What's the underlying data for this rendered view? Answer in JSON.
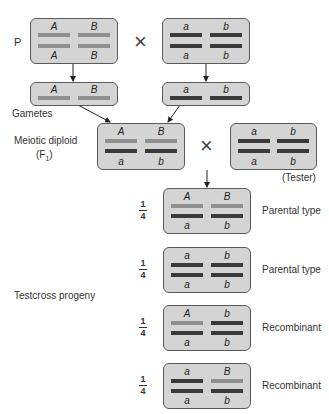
{
  "labels": {
    "p": "P",
    "gametes": "Gametes",
    "f1_line1": "Meiotic diploid",
    "f1_line2": "(F",
    "f1_sub": "1",
    "f1_close": ")",
    "tester": "(Tester)",
    "testcross_progeny": "Testcross progeny",
    "cross_symbol": "×"
  },
  "colors": {
    "box_fill": "#d4d4d4",
    "box_border": "#5a5a5a",
    "dominant_chromosome": "#8f8f8f",
    "recessive_chromosome": "#3a3a3a"
  },
  "parents": {
    "left": {
      "top": [
        "A",
        "B"
      ],
      "bottom": [
        "A",
        "B"
      ],
      "top_colors": [
        "light",
        "light"
      ],
      "bottom_colors": [
        "light",
        "light"
      ]
    },
    "right": {
      "top": [
        "a",
        "b"
      ],
      "bottom": [
        "a",
        "b"
      ],
      "top_colors": [
        "dark",
        "dark"
      ],
      "bottom_colors": [
        "dark",
        "dark"
      ]
    }
  },
  "gametes": {
    "left": {
      "top": [
        "A",
        "B"
      ],
      "colors": [
        "light",
        "light"
      ]
    },
    "right": {
      "top": [
        "a",
        "b"
      ],
      "colors": [
        "dark",
        "dark"
      ]
    }
  },
  "f1": {
    "top": [
      "A",
      "B"
    ],
    "bottom": [
      "a",
      "b"
    ]
  },
  "tester": {
    "top": [
      "a",
      "b"
    ],
    "bottom": [
      "a",
      "b"
    ]
  },
  "progeny": [
    {
      "fraction_num": "1",
      "fraction_den": "4",
      "top": [
        "A",
        "B"
      ],
      "bottom": [
        "a",
        "b"
      ],
      "top_colors": [
        "light",
        "light"
      ],
      "type": "Parental type"
    },
    {
      "fraction_num": "1",
      "fraction_den": "4",
      "top": [
        "a",
        "b"
      ],
      "bottom": [
        "a",
        "b"
      ],
      "top_colors": [
        "dark",
        "dark"
      ],
      "type": "Parental type"
    },
    {
      "fraction_num": "1",
      "fraction_den": "4",
      "top": [
        "A",
        "b"
      ],
      "bottom": [
        "a",
        "b"
      ],
      "top_colors": [
        "light",
        "dark"
      ],
      "type": "Recombinant"
    },
    {
      "fraction_num": "1",
      "fraction_den": "4",
      "top": [
        "a",
        "B"
      ],
      "bottom": [
        "a",
        "b"
      ],
      "top_colors": [
        "dark",
        "light"
      ],
      "type": "Recombinant"
    }
  ]
}
